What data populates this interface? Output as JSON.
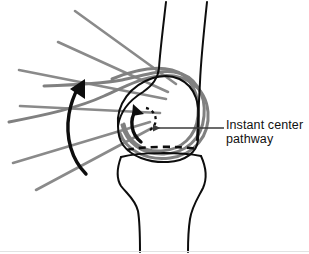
{
  "figure": {
    "background_color": "#ffffff",
    "width": 309,
    "height": 254,
    "annotation": {
      "line1": "Instant center",
      "line2": "pathway",
      "text_color": "#111111",
      "leader_line": {
        "from_x": 228,
        "from_y": 128,
        "to_x": 151,
        "to_y": 128,
        "color": "#3a3a3a",
        "arrowhead": "left"
      }
    },
    "colors": {
      "bone_outline": "#0d0d0d",
      "ghost_outline": "#808080",
      "guide_line": "#8a8a8a",
      "dashed_path": "#0d0d0d",
      "motion_arrow": "#0d0d0d",
      "bottom_rule": "#e2e2e2"
    },
    "elements": {
      "femur_label": "femur",
      "tibia_label": "tibia",
      "condyle_label": "femoral-condyle",
      "joint_line_label": "tibiofemoral-joint-line",
      "instant_center_arc_label": "instant-center-dashed-arc",
      "rotation_arrow_label": "condyle-rotation-arrow",
      "flexion_arrow_label": "femur-flexion-arrow",
      "guide_lines_count": 6,
      "ghost_outlines_count": 3
    }
  }
}
